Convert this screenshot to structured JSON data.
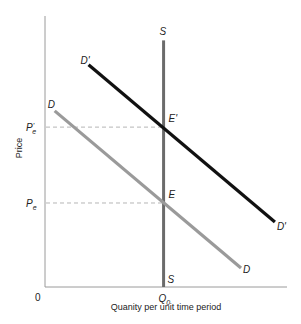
{
  "chart_data": {
    "type": "line",
    "title": "",
    "xlabel": "Quanity per unit time period",
    "ylabel": "Price",
    "xlim": [
      0,
      10
    ],
    "ylim": [
      0,
      10
    ],
    "origin_label": "0",
    "grid": false,
    "x_ticks": [
      {
        "value": 4.9,
        "label": "Q",
        "sub": "0"
      }
    ],
    "y_ticks": [
      {
        "value": 5.9,
        "label": "P",
        "sub": "e",
        "prime": "'"
      },
      {
        "value": 3.1,
        "label": "P",
        "sub": "e",
        "prime": ""
      }
    ],
    "series": [
      {
        "name": "S",
        "role": "supply",
        "color": "#6b6b6b",
        "points": [
          [
            4.9,
            9.1
          ],
          [
            4.9,
            0
          ]
        ],
        "start_label": "S",
        "end_label": "S"
      },
      {
        "name": "D'",
        "role": "demand-shifted",
        "color": "#111111",
        "points": [
          [
            1.8,
            8.2
          ],
          [
            9.5,
            2.4
          ]
        ],
        "start_label": "D'",
        "end_label": "D'"
      },
      {
        "name": "D",
        "role": "demand",
        "color": "#9a9a9a",
        "points": [
          [
            0.4,
            6.5
          ],
          [
            8.1,
            0.7
          ]
        ],
        "start_label": "D",
        "end_label": "D"
      }
    ],
    "reference_lines": [
      {
        "y": 5.9,
        "from_x": 0,
        "to_x": 4.9,
        "style": "dashed"
      },
      {
        "y": 3.1,
        "from_x": 0,
        "to_x": 4.9,
        "style": "dashed"
      }
    ],
    "annotations": [
      {
        "text": "E'",
        "x": 4.9,
        "y": 5.9
      },
      {
        "text": "E",
        "x": 4.9,
        "y": 3.1
      }
    ]
  }
}
